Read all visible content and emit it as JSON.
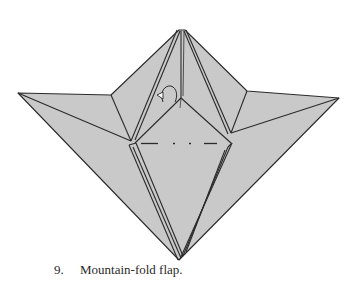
{
  "diagram": {
    "step_number": "9.",
    "instruction": "Mountain-fold flap.",
    "colors": {
      "paper": "#c9c9c9",
      "line": "#2b2b2b",
      "background": "#ffffff"
    },
    "symbols": [
      "mountain-fold-line",
      "mountain-fold-arrow"
    ]
  }
}
